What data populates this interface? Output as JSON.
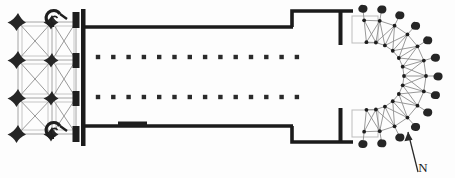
{
  "document": {
    "type": "architectural-floor-plan",
    "subject": "Gothic church ground plan",
    "orientation_label": "N",
    "background_color": "#fdfdfd",
    "ink_color": "#1e1e1e",
    "pier_color": "#262626",
    "thin_line_color": "#9a9a9a",
    "wall_color": "#1b1b1b"
  },
  "plan": {
    "canvas": {
      "width": 455,
      "height": 178
    },
    "west_block": {
      "name": "west-block",
      "bounds": {
        "x": 10,
        "y": 14,
        "width": 78,
        "height": 128
      },
      "bay_grid_columns": [
        18,
        49,
        80
      ],
      "bay_grid_rows": [
        22,
        60,
        98,
        134
      ],
      "outer_piers": [
        {
          "cx": 18,
          "cy": 22,
          "r": 12,
          "shape": "cruciform"
        },
        {
          "cx": 18,
          "cy": 60,
          "r": 12,
          "shape": "cruciform"
        },
        {
          "cx": 18,
          "cy": 98,
          "r": 12,
          "shape": "cruciform"
        },
        {
          "cx": 18,
          "cy": 134,
          "r": 12,
          "shape": "cruciform"
        }
      ],
      "middle_piers": [
        {
          "cx": 52,
          "cy": 22,
          "r": 8,
          "shape": "cruciform"
        },
        {
          "cx": 52,
          "cy": 60,
          "r": 9,
          "shape": "cruciform"
        },
        {
          "cx": 52,
          "cy": 98,
          "r": 9,
          "shape": "cruciform"
        },
        {
          "cx": 52,
          "cy": 134,
          "r": 8,
          "shape": "cruciform"
        }
      ],
      "east_piers": [
        {
          "cx": 76,
          "cy": 20,
          "w": 7,
          "h": 16,
          "shape": "rect"
        },
        {
          "cx": 76,
          "cy": 60,
          "w": 7,
          "h": 15,
          "shape": "rect"
        },
        {
          "cx": 76,
          "cy": 98,
          "w": 7,
          "h": 15,
          "shape": "rect"
        },
        {
          "cx": 76,
          "cy": 134,
          "w": 7,
          "h": 16,
          "shape": "rect"
        }
      ],
      "spiral_stairs": [
        {
          "name": "north-tower-stair",
          "cx": 54,
          "cy": 21,
          "r": 7
        },
        {
          "name": "south-tower-stair",
          "cx": 54,
          "cy": 133,
          "r": 7
        }
      ],
      "end_wall": {
        "x": 82,
        "y": 10,
        "width": 4,
        "height": 136
      }
    },
    "nave": {
      "name": "nave",
      "north_wall": {
        "x1": 86,
        "y1": 27,
        "x2": 292,
        "y2": 27
      },
      "south_wall": {
        "x1": 86,
        "y1": 126,
        "x2": 292,
        "y2": 126
      },
      "portal": {
        "x": 118,
        "y": 122,
        "width": 28,
        "height": 5
      },
      "arcade_north_y": 57,
      "arcade_south_y": 97,
      "arcade_x_start": 98,
      "arcade_x_step": 15.3,
      "arcade_count": 14,
      "pier_size": 4.4
    },
    "transept": {
      "name": "transept",
      "north_wall": {
        "x1": 292,
        "y1": 11,
        "x2": 352,
        "y2": 11
      },
      "south_wall": {
        "x1": 292,
        "y1": 142,
        "x2": 352,
        "y2": 142
      },
      "west_jamb_north": {
        "x1": 292,
        "y1": 11,
        "x2": 292,
        "y2": 27
      },
      "west_jamb_south": {
        "x1": 292,
        "y1": 126,
        "x2": 292,
        "y2": 142
      },
      "crossing_pier_north": {
        "x": 339,
        "y": 11,
        "width": 4,
        "height": 34
      },
      "crossing_pier_south": {
        "x": 339,
        "y": 108,
        "width": 4,
        "height": 34
      }
    },
    "chevet": {
      "name": "chevet-apse",
      "center": {
        "x": 370,
        "y": 76
      },
      "inner_radius": 34,
      "outer_radius": 56,
      "buttress_radius": 68,
      "ray_count": 13,
      "start_angle_deg": -96,
      "end_angle_deg": 96,
      "straight_bay_top": {
        "x": 352,
        "y": 16,
        "width": 26,
        "height": 28
      },
      "straight_bay_bottom": {
        "x": 352,
        "y": 108,
        "width": 26,
        "height": 28
      }
    },
    "north_arrow": {
      "name": "north-arrow",
      "tail": {
        "x": 418,
        "y": 172
      },
      "head": {
        "x": 408,
        "y": 132
      },
      "label": "N",
      "label_x": 423,
      "label_y": 172
    }
  },
  "legend": {
    "elements": [
      "cruciform pier",
      "spiral staircase",
      "nave arcade pier",
      "rib vault diagonal",
      "radiating chapel buttress",
      "masonry wall"
    ]
  }
}
